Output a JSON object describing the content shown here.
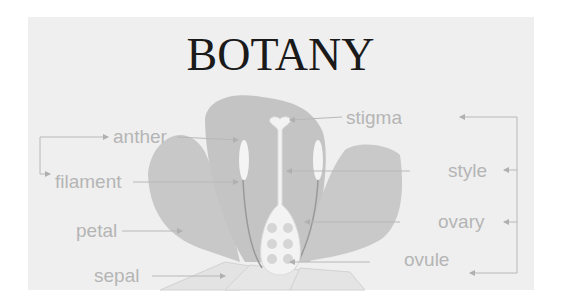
{
  "diagram": {
    "title": "BOTANY",
    "colors": {
      "panel_bg": "#efefef",
      "petal": "#c9c9c9",
      "pistil": "#f2f2f2",
      "label_text": "#b5b5b5",
      "leader_line": "#b8b8b8",
      "title_text": "#1a1a1a"
    },
    "labels": {
      "anther": "anther",
      "filament": "filament",
      "petal": "petal",
      "sepal": "sepal",
      "stigma": "stigma",
      "style": "style",
      "ovary": "ovary",
      "ovule": "ovule"
    },
    "groups": {
      "left_bracket": [
        "anther",
        "filament"
      ],
      "right_bracket": [
        "stigma",
        "style",
        "ovary",
        "ovule"
      ]
    }
  }
}
